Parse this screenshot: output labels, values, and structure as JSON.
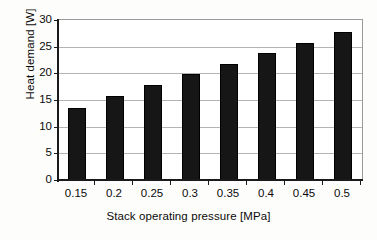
{
  "chart_data": {
    "type": "bar",
    "title": "",
    "xlabel": "Stack operating pressure [MPa]",
    "ylabel": "Heat demand [W]",
    "categories": [
      "0.15",
      "0.2",
      "0.25",
      "0.3",
      "0.35",
      "0.4",
      "0.45",
      "0.5"
    ],
    "values": [
      13.5,
      15.8,
      17.8,
      19.8,
      21.8,
      23.9,
      25.7,
      27.8
    ],
    "ylim": [
      0,
      30
    ],
    "yticks": [
      0,
      5,
      10,
      15,
      20,
      25,
      30
    ],
    "ytick_labels": [
      "0",
      "5",
      "10",
      "15",
      "20",
      "25",
      "30"
    ],
    "grid": "horizontal",
    "legend": "none",
    "series": [
      {
        "name": "Heat demand",
        "values": [
          13.5,
          15.8,
          17.8,
          19.8,
          21.8,
          23.9,
          25.7,
          27.8
        ],
        "color": "#161616"
      }
    ],
    "colors": {
      "bar": "#161616",
      "gridline": "#b4b4b4",
      "axis": "#1a1a1a",
      "plot_background": "#ffffff",
      "figure_background": "#fdfdfb",
      "text": "#0b0b0b"
    }
  }
}
